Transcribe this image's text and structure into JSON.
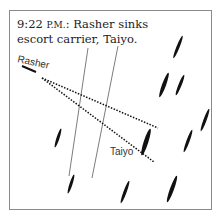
{
  "caption": {
    "time": "9:22",
    "ampm": "P.M.",
    "text": ": Rasher sinks escort carrier, Taiyo."
  },
  "labels": {
    "submarine": "Rasher",
    "target": "Taiyo"
  },
  "colors": {
    "ink": "#111111",
    "frame": "#8a8a8a"
  }
}
